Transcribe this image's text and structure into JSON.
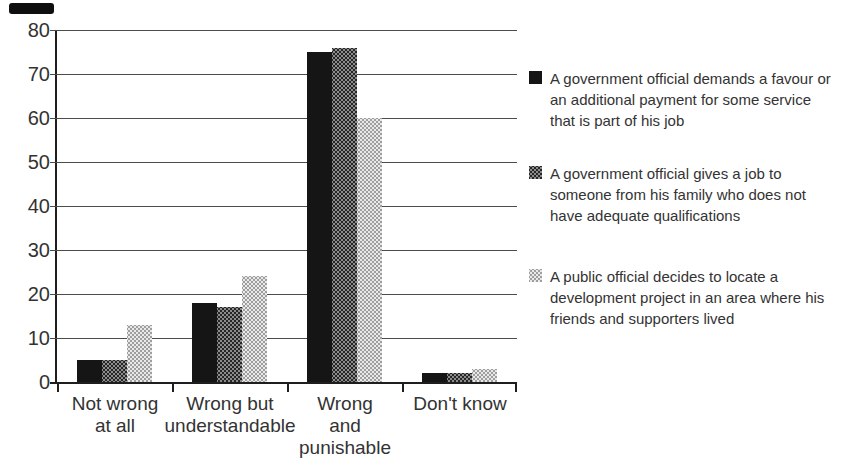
{
  "chart_data": {
    "type": "bar",
    "categories": [
      "Not wrong\nat all",
      "Wrong but\nunderstandable",
      "Wrong\nand\npunishable",
      "Don't know"
    ],
    "series": [
      {
        "name": "A government official demands a favour or an additional payment for some service that is part of his job",
        "swatch": "solid-black",
        "color": "#151515",
        "values": [
          5,
          18,
          75,
          2
        ]
      },
      {
        "name": "A government official gives a job to someone from his family who does not have adequate qualifications",
        "swatch": "halftone-dark-gray",
        "color": "#5e5e5e",
        "values": [
          5,
          17,
          76,
          2
        ]
      },
      {
        "name": "A public official decides to locate a development project in an area where his friends and supporters lived",
        "swatch": "halftone-light-gray",
        "color": "#c9c9c9",
        "values": [
          13,
          24,
          60,
          3
        ]
      }
    ],
    "title": "",
    "xlabel": "",
    "ylabel": "",
    "ylim": [
      0,
      80
    ],
    "yticks": [
      0,
      10,
      20,
      30,
      40,
      50,
      60,
      70,
      80
    ],
    "grid": true,
    "legend_position": "right"
  },
  "colors": {
    "background": "#ffffff",
    "text": "#333333",
    "axis": "#1e1e1e",
    "gridline": "#4c4c4c"
  }
}
